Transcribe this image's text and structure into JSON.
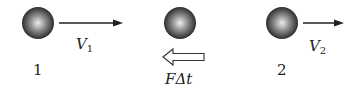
{
  "diagram": {
    "balls": [
      {
        "id": "ball-1",
        "cx": 38,
        "cy": 23,
        "r": 16
      },
      {
        "id": "ball-middle",
        "cx": 180,
        "cy": 23,
        "r": 16
      },
      {
        "id": "ball-2",
        "cx": 282,
        "cy": 23,
        "r": 16
      }
    ],
    "labels": {
      "v1_symbol": "V",
      "v1_sub": "1",
      "v2_symbol": "V",
      "v2_sub": "2",
      "ball1": "1",
      "ball2": "2",
      "impulse": "FΔt"
    },
    "colors": {
      "ball_dark": "#1a1a1a",
      "ball_light": "#e8e8e8",
      "line": "#222222"
    }
  }
}
